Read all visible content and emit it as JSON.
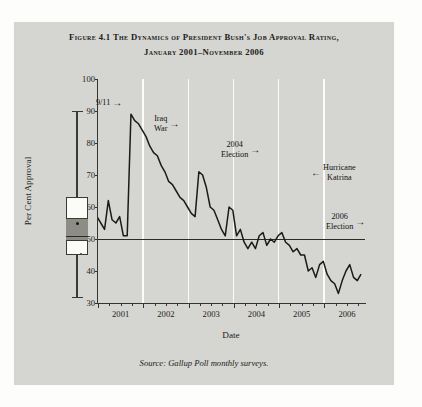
{
  "figure": {
    "title_line1": "Figure 4.1 The Dynamics of President Bush's Job Approval Rating,",
    "title_line2": "January 2001–November 2006",
    "source": "Source: Gallup Poll monthly surveys."
  },
  "chart_data": {
    "type": "line",
    "title": "Figure 4.1 The Dynamics of President Bush's Job Approval Rating, January 2001–November 2006",
    "xlabel": "Date",
    "ylabel": "Per Cent Approval",
    "ylim": [
      30,
      100
    ],
    "yticks": [
      30,
      40,
      50,
      60,
      70,
      80,
      90,
      100
    ],
    "xlim": [
      2001.0,
      2006.92
    ],
    "xticks": [
      2001,
      2002,
      2003,
      2004,
      2005,
      2006
    ],
    "xtick_labels": [
      "2001",
      "2002",
      "2003",
      "2004",
      "2005",
      "2006"
    ],
    "grid": "vertical-white-at-year-boundaries",
    "legend": "none",
    "reference_line": {
      "y": 50,
      "label": "50 per cent"
    },
    "series": [
      {
        "name": "Presidential job approval (per cent)",
        "x": [
          2001.0,
          2001.083,
          2001.167,
          2001.25,
          2001.333,
          2001.417,
          2001.5,
          2001.583,
          2001.667,
          2001.75,
          2001.833,
          2001.917,
          2002.0,
          2002.083,
          2002.167,
          2002.25,
          2002.333,
          2002.417,
          2002.5,
          2002.583,
          2002.667,
          2002.75,
          2002.833,
          2002.917,
          2003.0,
          2003.083,
          2003.167,
          2003.25,
          2003.333,
          2003.417,
          2003.5,
          2003.583,
          2003.667,
          2003.75,
          2003.833,
          2003.917,
          2004.0,
          2004.083,
          2004.167,
          2004.25,
          2004.333,
          2004.417,
          2004.5,
          2004.583,
          2004.667,
          2004.75,
          2004.833,
          2004.917,
          2005.0,
          2005.083,
          2005.167,
          2005.25,
          2005.333,
          2005.417,
          2005.5,
          2005.583,
          2005.667,
          2005.75,
          2005.833,
          2005.917,
          2006.0,
          2006.083,
          2006.167,
          2006.25,
          2006.333,
          2006.417,
          2006.5,
          2006.583,
          2006.667,
          2006.75,
          2006.833
        ],
        "values": [
          57,
          55,
          53,
          62,
          56,
          55,
          57,
          51,
          51,
          89,
          87,
          86,
          84,
          82,
          79,
          77,
          76,
          73,
          71,
          68,
          67,
          65,
          63,
          62,
          60,
          58,
          57,
          71,
          70,
          66,
          60,
          59,
          56,
          53,
          51,
          60,
          59,
          51,
          53,
          49,
          47,
          49,
          47,
          51,
          52,
          48,
          50,
          49,
          51,
          52,
          49,
          48,
          46,
          47,
          45,
          45,
          40,
          41,
          38,
          42,
          43,
          39,
          37,
          36,
          33,
          37,
          40,
          42,
          38,
          37,
          39
        ]
      }
    ],
    "boxplot": {
      "position": "left-margin-marginal-distribution",
      "min": 32,
      "q1": 45,
      "median": 51,
      "q3": 63,
      "max": 90,
      "mean": 55
    },
    "annotations": [
      {
        "text": "9/11",
        "arrow": "right",
        "points_to_x": 2001.75,
        "points_to_y": 89
      },
      {
        "text": "Iraq\nWar",
        "text_line1": "Iraq",
        "text_line2": "War",
        "arrow": "right",
        "points_to_x": 2003.25,
        "points_to_y": 71
      },
      {
        "text": "2004\nElection",
        "text_line1": "2004",
        "text_line2": "Election",
        "arrow": "right",
        "points_to_x": 2004.833,
        "points_to_y": 50
      },
      {
        "text": "Hurricane\nKatrina",
        "text_line1": "Hurricane",
        "text_line2": "Katrina",
        "arrow": "left",
        "points_to_x": 2005.667,
        "points_to_y": 40
      },
      {
        "text": "2006\nElection",
        "text_line1": "2006",
        "text_line2": "Election",
        "arrow": "right",
        "points_to_x": 2006.833,
        "points_to_y": 39
      }
    ]
  },
  "axes": {
    "y_label": "Per Cent Approval",
    "x_label": "Date",
    "y_ticks": [
      "100",
      "90",
      "80",
      "70",
      "60",
      "50",
      "40",
      "30"
    ],
    "x_ticks": [
      "2001",
      "2002",
      "2003",
      "2004",
      "2005",
      "2006"
    ]
  },
  "annotations": {
    "a1": {
      "l1": "9/11",
      "arrow": "→"
    },
    "a2": {
      "l1": "Iraq",
      "l2": "War",
      "arrow": "→"
    },
    "a3": {
      "l1": "2004",
      "l2": "Election",
      "arrow": "→"
    },
    "a4": {
      "l1": "Hurricane",
      "l2": "Katrina",
      "arrow": "←"
    },
    "a5": {
      "l1": "2006",
      "l2": "Election",
      "arrow": "→"
    }
  },
  "colors": {
    "panel_bg": "#d5d5d1",
    "line": "#1a1a16",
    "gridline": "#fbfbfa",
    "axis": "#35352f",
    "box_fill": "#fbfbf8",
    "box_band": "#8d8d85"
  }
}
